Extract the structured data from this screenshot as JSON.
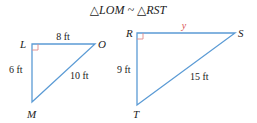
{
  "title": "△LOM ~ △RST",
  "colors": {
    "line": "#5b9bd5",
    "right_angle": "#e08a8a",
    "text": "#222222",
    "unknown": "#d9534f"
  },
  "triangle_lom": {
    "vertices": {
      "L": "L",
      "O": "O",
      "M": "M"
    },
    "sides": {
      "LO": "8 ft",
      "LM": "6 ft",
      "OM": "10 ft"
    }
  },
  "triangle_rst": {
    "vertices": {
      "R": "R",
      "S": "S",
      "T": "T"
    },
    "sides": {
      "RS": "y",
      "RT": "9 ft",
      "ST": "15 ft"
    }
  }
}
